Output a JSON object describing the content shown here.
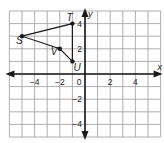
{
  "chart_data": {
    "type": "scatter",
    "title": "",
    "xlabel": "x",
    "ylabel": "y",
    "xlim": [
      -6,
      6
    ],
    "ylim": [
      -5,
      5
    ],
    "grid": true,
    "x_ticks": [
      -4,
      -2,
      0,
      2,
      4
    ],
    "y_ticks": [
      -4,
      -2,
      2,
      4
    ],
    "x_tick_labels": [
      "−4",
      "−2",
      "0",
      "2",
      "4"
    ],
    "y_tick_labels": [
      "−4",
      "−2",
      "2",
      "4"
    ],
    "points": [
      {
        "label": "S",
        "x": -5,
        "y": 3
      },
      {
        "label": "T",
        "x": -1,
        "y": 4
      },
      {
        "label": "U",
        "x": -1,
        "y": 1
      },
      {
        "label": "V",
        "x": -2,
        "y": 2
      }
    ],
    "polygon": [
      "S",
      "T",
      "U",
      "V"
    ],
    "colors": {
      "grid": "#9a9a9a",
      "axis": "#1a1a1a",
      "shape": "#1a1a1a"
    }
  }
}
